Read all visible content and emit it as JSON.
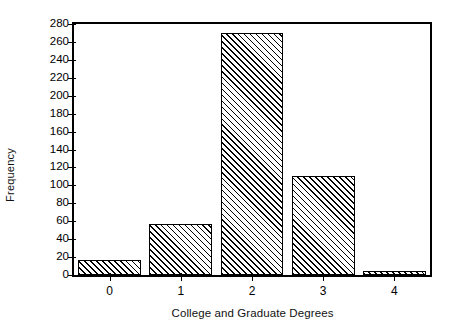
{
  "chart_data": {
    "type": "bar",
    "title": "",
    "xlabel": "College and Graduate Degrees",
    "ylabel": "Frequency",
    "categories": [
      "0",
      "1",
      "2",
      "3",
      "4"
    ],
    "values": [
      17,
      57,
      270,
      110,
      4
    ],
    "series": [
      {
        "name": "Frequency",
        "values": [
          17,
          57,
          270,
          110,
          4
        ]
      }
    ],
    "ylim": [
      0,
      280
    ],
    "xlim": [
      -0.5,
      4.5
    ],
    "yticks": [
      0,
      20,
      40,
      60,
      80,
      100,
      120,
      140,
      160,
      180,
      200,
      220,
      240,
      260,
      280
    ],
    "ytick_labels": [
      "0",
      "20",
      "40",
      "60",
      "80",
      "100",
      "120",
      "140",
      "160",
      "180",
      "200",
      "220",
      "240",
      "260",
      "280"
    ],
    "xtick_labels": [
      "0",
      "1",
      "2",
      "3",
      "4"
    ],
    "grid": false,
    "legend": false,
    "legend_position": "none",
    "bar_fill": "#ffffff",
    "bar_edge": "#000000",
    "bar_hatch": "forward-diagonal",
    "frame": true,
    "background": "#ffffff"
  }
}
